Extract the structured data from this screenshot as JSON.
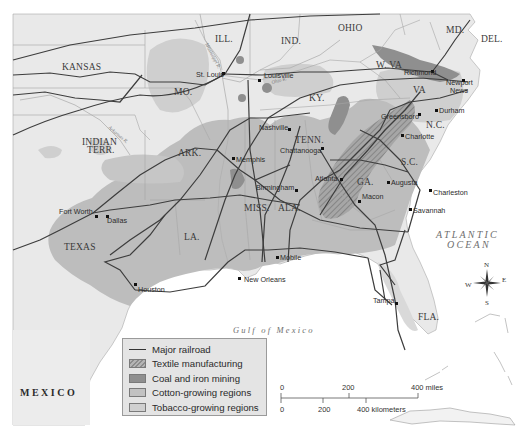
{
  "map": {
    "colors": {
      "land": "#e9e9e9",
      "water": "#ffffff",
      "cotton": "#bdbdbd",
      "tobacco": "#cfcfcf",
      "coal": "#8f8f8f",
      "textile_hatch": "#8a8a8a",
      "railroad": "#3d3d3d",
      "border": "#9e9e9e"
    },
    "states": {
      "kansas": "KANSAS",
      "ill": "ILL.",
      "ind": "IND.",
      "ohio": "OHIO",
      "md": "MD.",
      "del": "DEL.",
      "wva": "W. VA",
      "va": "VA",
      "mo": "MO.",
      "ky": "KY.",
      "nc": "N.C.",
      "indian_terr_1": "INDIAN",
      "indian_terr_2": "TERR.",
      "ark": "ARK.",
      "tenn": "TENN.",
      "sc": "S.C.",
      "ga": "GA.",
      "miss": "MISS.",
      "ala": "ALA.",
      "la": "LA.",
      "texas": "TEXAS",
      "fla": "FLA."
    },
    "cities": {
      "st_louis": "St. Louis",
      "louisville": "Louisville",
      "richmond": "Richmond",
      "newport_news_1": "Newport",
      "newport_news_2": "News",
      "durham": "Durham",
      "greensboro": "Greensboro",
      "charlotte": "Charlotte",
      "nashville": "Nashville",
      "chattanooga": "Chattanooga",
      "memphis": "Memphis",
      "atlanta": "Atlanta",
      "augusta": "Augusta",
      "birmingham": "Birmingham",
      "charleston": "Charleston",
      "macon": "Macon",
      "savannah": "Savannah",
      "fort_worth": "Fort Worth",
      "dallas": "Dallas",
      "mobile": "Mobile",
      "new_orleans": "New Orleans",
      "houston": "Houston",
      "tampa": "Tampa"
    },
    "rivers": {
      "ohio": "Ohio R.",
      "arkansas": "Arkansas R.",
      "mississippi": "Mississippi R."
    },
    "water_bodies": {
      "atlantic_1": "ATLANTIC",
      "atlantic_2": "OCEAN",
      "gulf": "Gulf of Mexico"
    },
    "country": "MEXICO",
    "compass": {
      "n": "N",
      "s": "S",
      "e": "E",
      "w": "W"
    }
  },
  "legend": {
    "items": [
      {
        "type": "line",
        "label": "Major railroad"
      },
      {
        "type": "textile",
        "label": "Textile manufacturing"
      },
      {
        "type": "coal",
        "label": "Coal and iron mining"
      },
      {
        "type": "cotton",
        "label": "Cotton-growing regions"
      },
      {
        "type": "tobacco",
        "label": "Tobacco-growing regions"
      }
    ]
  },
  "scale": {
    "miles": {
      "zero": "0",
      "mid": "200",
      "end": "400 miles"
    },
    "km": {
      "zero": "0",
      "mid": "200",
      "end": "400 kilometers"
    }
  }
}
